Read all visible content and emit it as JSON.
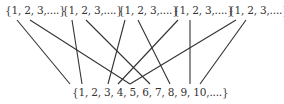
{
  "top_sets": [
    {
      "label": "{1, 2, 3,....}",
      "x": 5
    },
    {
      "label": "{1, 2, 3,....}",
      "x": 62
    },
    {
      "label": "{1, 2, 3,....}",
      "x": 118
    },
    {
      "label": "{1, 2, 3,....}",
      "x": 173
    },
    {
      "label": "{1, 2, 3,....}",
      "x": 228
    }
  ],
  "bottom_set": {
    "label": "{1, 2, 3, 4, 5, 6, 7, 8, 9, 10,....}"
  },
  "lines": [
    [
      17,
      20,
      70,
      84
    ],
    [
      30,
      20,
      130,
      84
    ],
    [
      72,
      20,
      82,
      84
    ],
    [
      86,
      20,
      150,
      84
    ],
    [
      125,
      20,
      108,
      84
    ],
    [
      138,
      20,
      170,
      84
    ],
    [
      178,
      20,
      118,
      84
    ],
    [
      190,
      20,
      190,
      84
    ],
    [
      236,
      20,
      130,
      84
    ],
    [
      246,
      20,
      200,
      84
    ]
  ],
  "colors": {
    "line": "#333333",
    "text": "#333333"
  }
}
